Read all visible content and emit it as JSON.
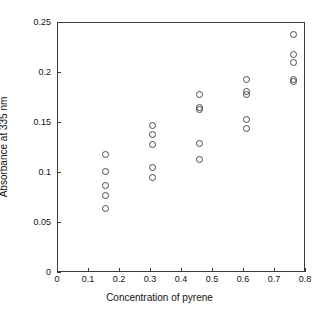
{
  "chart_data": {
    "type": "scatter",
    "title": "",
    "xlabel": "Concentration of pyrene",
    "ylabel": "Absorbance at 335 nm",
    "xlim": [
      0,
      0.8
    ],
    "ylim": [
      0,
      0.25
    ],
    "xticks": [
      0,
      0.1,
      0.2,
      0.3,
      0.4,
      0.5,
      0.6,
      0.7,
      0.8
    ],
    "xticklabels": [
      "0",
      "0.1",
      "0.2",
      "0.3",
      "0.4",
      "0.5",
      "0.6",
      "0.7",
      "0.8"
    ],
    "yticks": [
      0,
      0.05,
      0.1,
      0.15,
      0.2,
      0.25
    ],
    "yticklabels": [
      "0",
      "0.05",
      "0.1",
      "0.15",
      "0.2",
      "0.25"
    ],
    "grid": false,
    "legend": null,
    "marker": "open-circle",
    "marker_color": "#4a4a4a",
    "points": [
      {
        "x": 0.155,
        "y": 0.118
      },
      {
        "x": 0.155,
        "y": 0.101
      },
      {
        "x": 0.155,
        "y": 0.087
      },
      {
        "x": 0.155,
        "y": 0.077
      },
      {
        "x": 0.155,
        "y": 0.064
      },
      {
        "x": 0.306,
        "y": 0.147
      },
      {
        "x": 0.306,
        "y": 0.138
      },
      {
        "x": 0.306,
        "y": 0.128
      },
      {
        "x": 0.306,
        "y": 0.105
      },
      {
        "x": 0.306,
        "y": 0.095
      },
      {
        "x": 0.458,
        "y": 0.178
      },
      {
        "x": 0.458,
        "y": 0.165
      },
      {
        "x": 0.458,
        "y": 0.163
      },
      {
        "x": 0.458,
        "y": 0.129
      },
      {
        "x": 0.458,
        "y": 0.113
      },
      {
        "x": 0.61,
        "y": 0.193
      },
      {
        "x": 0.61,
        "y": 0.181
      },
      {
        "x": 0.61,
        "y": 0.178
      },
      {
        "x": 0.61,
        "y": 0.153
      },
      {
        "x": 0.61,
        "y": 0.144
      },
      {
        "x": 0.761,
        "y": 0.238
      },
      {
        "x": 0.761,
        "y": 0.218
      },
      {
        "x": 0.761,
        "y": 0.21
      },
      {
        "x": 0.761,
        "y": 0.193
      },
      {
        "x": 0.761,
        "y": 0.191
      }
    ]
  }
}
